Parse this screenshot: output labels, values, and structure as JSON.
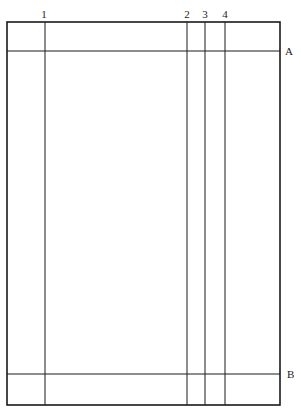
{
  "diagram": {
    "type": "page-grid-layout",
    "frame": {
      "x1": 7,
      "y1": 22,
      "x2": 280,
      "y2": 405,
      "color": "#1a1a1a"
    },
    "vertical_lines": [
      {
        "id": "1",
        "label": "1",
        "x": 45
      },
      {
        "id": "2",
        "label": "2",
        "x": 187
      },
      {
        "id": "3",
        "label": "3",
        "x": 205
      },
      {
        "id": "4",
        "label": "4",
        "x": 225
      }
    ],
    "horizontal_lines": [
      {
        "id": "A",
        "label": "A",
        "y": 51
      },
      {
        "id": "B",
        "label": "B",
        "y": 374
      }
    ]
  },
  "labels": {
    "v1": "1",
    "v2": "2",
    "v3": "3",
    "v4": "4",
    "hA": "A",
    "hB": "B"
  }
}
